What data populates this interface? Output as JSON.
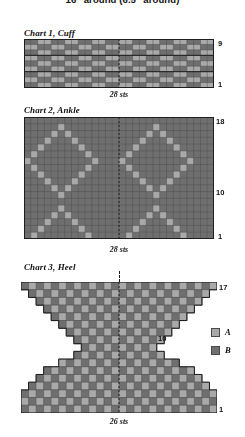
{
  "document": {
    "top_title": "16\" around (6.5\" around)"
  },
  "colors": {
    "A": "#a9a9a9",
    "B": "#6f6f6f",
    "grid_line": "#4f4f4f",
    "heavy_line": "#1e1e1e",
    "background": "#ffffff",
    "text": "#111111"
  },
  "legend": {
    "position": "right-middle",
    "items": [
      {
        "key": "A",
        "label": "A",
        "color": "#a9a9a9"
      },
      {
        "key": "B",
        "label": "B",
        "color": "#6f6f6f"
      }
    ]
  },
  "charts": [
    {
      "id": "chart1",
      "title": "Chart 1, Cuff",
      "stitches": 28,
      "rows": 9,
      "sts_label": "28 sts",
      "row_numbers": [
        {
          "row": 9,
          "label": "9"
        },
        {
          "row": 1,
          "label": "1"
        }
      ],
      "center_line": true,
      "shape": "rectangle",
      "heavy_rows": [
        6,
        3
      ],
      "pattern_note": "2x2 plaid checkerboard of A and B",
      "cells": [
        "BBAABBAABBAABBAABBAABBAABBAA",
        "AABBAABBAABBAABBAABBAABBAABB",
        "BBAABBAABBAABBAABBAABBAABBAA",
        "AABBAABBAABBAABBAABBAABBAABB",
        "BBAABBAABBAABBAABBAABBAABBAA",
        "AABBAABBAABBAABBAABBAABBAABB",
        "BBAABBAABBAABBAABBAABBAABBAA",
        "AABBAABBAABBAABBAABBAABBAABB",
        "BBAABBAABBAABBAABBAABBAABBAA"
      ]
    },
    {
      "id": "chart2",
      "title": "Chart 2, Ankle",
      "stitches": 28,
      "rows": 18,
      "sts_label": "28 sts",
      "row_numbers": [
        {
          "row": 18,
          "label": "18"
        },
        {
          "row": 10,
          "label": "10"
        },
        {
          "row": 1,
          "label": "1"
        }
      ],
      "center_line": true,
      "shape": "rectangle",
      "pattern_note": "argyle / diamond lattice of A on B ground, two repeats of 14 sts",
      "cells": [
        "BBBBBBBBBBBBBBBBBBBBBBBBBBBB",
        "BBBBBABBBBBBBBBBBBBABBBBBBBB",
        "BBBBABABBBBBBBBBBBABABBBBBBB",
        "BBBABBBABBBBBBBBBABBBABBBBBB",
        "BBABBBBBABBBBBBBABBBBBABBBBB",
        "BABBBBBBBABBBBBABBBBBBBABBBB",
        "ABBBBBBBBBABBBABBBBBBBBBABBB",
        "BABBBBBBBABBBBBABBBBBBBABBBB",
        "BBABBBBBABBBBBBBABBBBBABBBBB",
        "BBBABBBABBBBBBBBBABBBABBBBBB",
        "BBBBABABBBBBBBBBBBABABBBBBBB",
        "BBBBBABBBBBBBBBBBBBABBBBBBBB",
        "BBBBBBBBBBBBBBBBBBBBBBBBBBBB",
        "BBBBBABBBBBBBBBBBBBABBBBBBBB",
        "BBBBABABBBBBBBBBBBABABBBBBBB",
        "BBBABBBABBBBBBBBBABBBABBBBBB",
        "BBABBBBBABBBBBBBABBBBBABBBBB",
        "BABBBBBBBABBBBBABBBBBBBABBBB"
      ]
    },
    {
      "id": "chart3",
      "title": "Chart 3, Heel",
      "stitches": 26,
      "rows": 17,
      "sts_label": "26 sts",
      "row_numbers": [
        {
          "row": 17,
          "label": "17"
        },
        {
          "row": 10,
          "label": "10"
        },
        {
          "row": 1,
          "label": "1"
        }
      ],
      "center_line": true,
      "shape": "hourglass",
      "pattern_note": "hourglass silhouette, stepped decreases narrowing to the waist then widening; 1x1 checkerboard fill of A and B",
      "row_widths": [
        26,
        24,
        22,
        20,
        18,
        16,
        14,
        12,
        10,
        12,
        16,
        20,
        22,
        24,
        26,
        26,
        26
      ],
      "waist_row": 9
    }
  ]
}
